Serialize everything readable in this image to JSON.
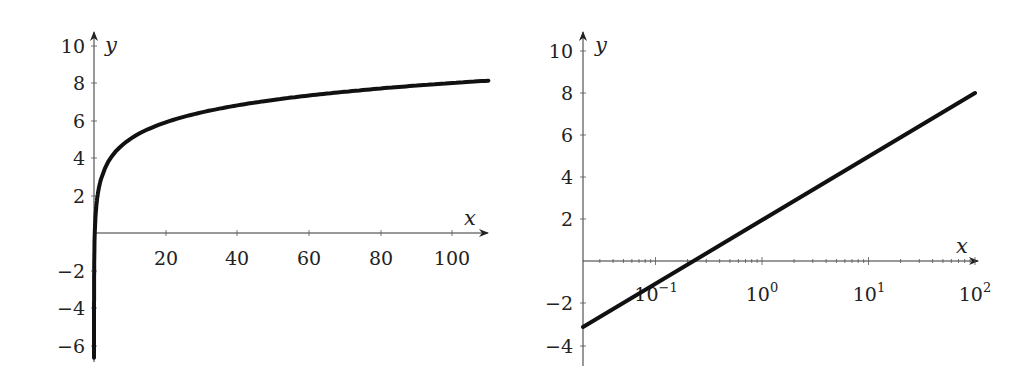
{
  "chart_data": [
    {
      "type": "line",
      "title": "",
      "xlabel": "x",
      "ylabel": "y",
      "xscale": "linear",
      "xlim": [
        0,
        110
      ],
      "ylim": [
        -6.5,
        10.5
      ],
      "xticks": [
        20,
        40,
        60,
        80,
        100
      ],
      "xtick_labels": [
        "20",
        "40",
        "60",
        "80",
        "100"
      ],
      "yticks": [
        -6,
        -4,
        -2,
        2,
        4,
        6,
        8,
        10
      ],
      "ytick_labels": [
        "−6",
        "−4",
        "−2",
        "2",
        "4",
        "6",
        "8",
        "10"
      ],
      "grid": false,
      "legend": null,
      "series": [
        {
          "name": "y = 3·log10(x) + 2",
          "x": [
            0.0013,
            0.01,
            0.1,
            1,
            2,
            5,
            10,
            20,
            40,
            60,
            80,
            100,
            110
          ],
          "y": [
            -5.6,
            -4.0,
            -1.0,
            2.0,
            2.9,
            4.1,
            5.0,
            5.9,
            6.8,
            7.3,
            7.7,
            8.0,
            8.1
          ]
        }
      ]
    },
    {
      "type": "line",
      "title": "",
      "xlabel": "x",
      "ylabel": "y",
      "xscale": "log",
      "xlim": [
        0.02,
        150
      ],
      "ylim": [
        -4.5,
        10.5
      ],
      "xticks": [
        0.1,
        1,
        10,
        100
      ],
      "xtick_labels": [
        "10^-1",
        "10^0",
        "10^1",
        "10^2"
      ],
      "yticks": [
        -4,
        -2,
        2,
        4,
        6,
        8,
        10
      ],
      "ytick_labels": [
        "−4",
        "−2",
        "2",
        "4",
        "6",
        "8",
        "10"
      ],
      "grid": false,
      "legend": null,
      "series": [
        {
          "name": "y = 3·log10(x) + 2",
          "x": [
            0.02,
            0.1,
            0.215,
            1,
            10,
            100
          ],
          "y": [
            -3.1,
            -1.0,
            0.0,
            2.0,
            5.0,
            8.0
          ]
        }
      ]
    }
  ],
  "left": {
    "ylabel": "y",
    "xlabel": "x",
    "yticks": [
      "10",
      "8",
      "6",
      "4",
      "2",
      "−2",
      "−4",
      "−6"
    ],
    "xticks": [
      "20",
      "40",
      "60",
      "80",
      "100"
    ]
  },
  "right": {
    "ylabel": "y",
    "xlabel": "x",
    "yticks": [
      "10",
      "8",
      "6",
      "4",
      "2",
      "−2",
      "−4"
    ],
    "xticks": [
      {
        "base": "10",
        "exp": "−1"
      },
      {
        "base": "10",
        "exp": "0"
      },
      {
        "base": "10",
        "exp": "1"
      },
      {
        "base": "10",
        "exp": "2"
      }
    ]
  }
}
